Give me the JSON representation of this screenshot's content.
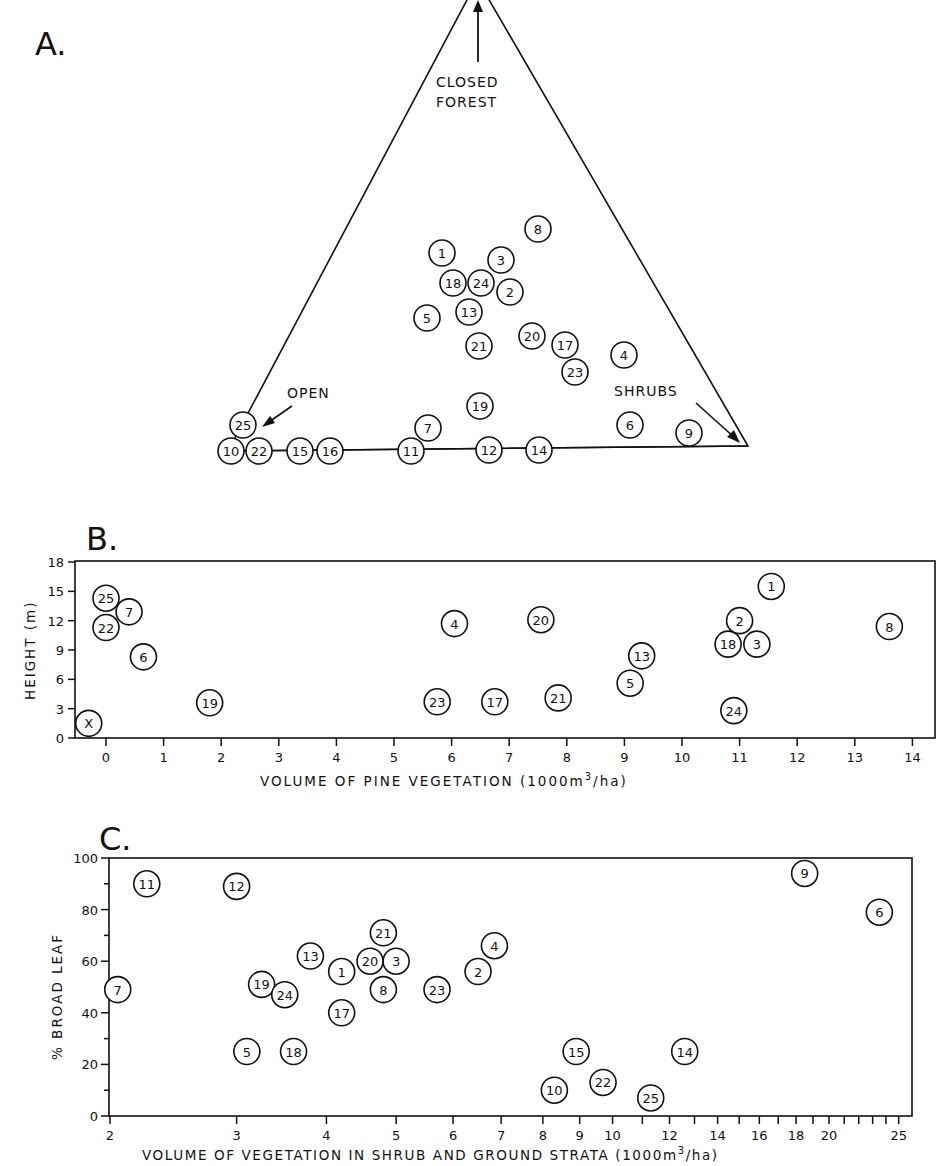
{
  "chart_data": [
    {
      "panel": "A.",
      "type": "scatter",
      "subtype": "ternary",
      "title": "A.",
      "vertices": {
        "top": "CLOSED FOREST",
        "left": "OPEN",
        "right": "SHRUBS"
      },
      "points": [
        {
          "id": "8",
          "x": 538,
          "y": 229
        },
        {
          "id": "1",
          "x": 442,
          "y": 253
        },
        {
          "id": "3",
          "x": 501,
          "y": 260
        },
        {
          "id": "18",
          "x": 453,
          "y": 283
        },
        {
          "id": "24",
          "x": 481,
          "y": 283
        },
        {
          "id": "2",
          "x": 510,
          "y": 292
        },
        {
          "id": "5",
          "x": 427,
          "y": 318
        },
        {
          "id": "13",
          "x": 469,
          "y": 312
        },
        {
          "id": "20",
          "x": 532,
          "y": 336
        },
        {
          "id": "17",
          "x": 565,
          "y": 345
        },
        {
          "id": "21",
          "x": 479,
          "y": 346
        },
        {
          "id": "4",
          "x": 624,
          "y": 355
        },
        {
          "id": "23",
          "x": 575,
          "y": 372
        },
        {
          "id": "19",
          "x": 480,
          "y": 406
        },
        {
          "id": "7",
          "x": 428,
          "y": 428
        },
        {
          "id": "6",
          "x": 630,
          "y": 425
        },
        {
          "id": "9",
          "x": 689,
          "y": 433
        },
        {
          "id": "25",
          "x": 243,
          "y": 425
        },
        {
          "id": "10",
          "x": 231,
          "y": 451
        },
        {
          "id": "22",
          "x": 259,
          "y": 451
        },
        {
          "id": "15",
          "x": 300,
          "y": 451
        },
        {
          "id": "16",
          "x": 330,
          "y": 451
        },
        {
          "id": "11",
          "x": 411,
          "y": 451
        },
        {
          "id": "12",
          "x": 489,
          "y": 450
        },
        {
          "id": "14",
          "x": 539,
          "y": 450
        }
      ]
    },
    {
      "panel": "B.",
      "type": "scatter",
      "title": "B.",
      "xlabel": "VOLUME OF PINE VEGETATION (1000m3/ha)",
      "xlabel_main": "VOLUME OF PINE VEGETATION (1000m",
      "xlabel_sup": "3",
      "xlabel_end": "/ha)",
      "ylabel": "HEIGHT (m)",
      "xlim": [
        -0.6,
        14.5
      ],
      "ylim": [
        0,
        18
      ],
      "xticks": [
        0,
        1,
        2,
        3,
        4,
        5,
        6,
        7,
        8,
        9,
        10,
        11,
        12,
        13,
        14
      ],
      "yticks": [
        0,
        3,
        6,
        9,
        12,
        15,
        18
      ],
      "points": [
        {
          "id": "X",
          "x": -0.3,
          "y": 1.5
        },
        {
          "id": "25",
          "x": 0.0,
          "y": 14.3
        },
        {
          "id": "22",
          "x": 0.0,
          "y": 11.3
        },
        {
          "id": "7",
          "x": 0.4,
          "y": 12.9
        },
        {
          "id": "6",
          "x": 0.65,
          "y": 8.3
        },
        {
          "id": "19",
          "x": 1.8,
          "y": 3.6
        },
        {
          "id": "4",
          "x": 6.05,
          "y": 11.7
        },
        {
          "id": "23",
          "x": 5.75,
          "y": 3.7
        },
        {
          "id": "17",
          "x": 6.75,
          "y": 3.7
        },
        {
          "id": "20",
          "x": 7.55,
          "y": 12.1
        },
        {
          "id": "21",
          "x": 7.85,
          "y": 4.1
        },
        {
          "id": "13",
          "x": 9.3,
          "y": 8.4
        },
        {
          "id": "5",
          "x": 9.1,
          "y": 5.6
        },
        {
          "id": "1",
          "x": 11.55,
          "y": 15.5
        },
        {
          "id": "2",
          "x": 11.0,
          "y": 12.0
        },
        {
          "id": "18",
          "x": 10.8,
          "y": 9.6
        },
        {
          "id": "3",
          "x": 11.3,
          "y": 9.6
        },
        {
          "id": "24",
          "x": 10.9,
          "y": 2.8
        },
        {
          "id": "8",
          "x": 13.6,
          "y": 11.4
        }
      ]
    },
    {
      "panel": "C.",
      "type": "scatter",
      "title": "C.",
      "xscale": "log",
      "xlabel": "VOLUME OF VEGETATION IN SHRUB AND GROUND STRATA (1000m3/ha)",
      "xlabel_main": "VOLUME OF VEGETATION IN SHRUB AND GROUND STRATA (1000m",
      "xlabel_sup": "3",
      "xlabel_end": "/ha)",
      "ylabel": "% BROAD LEAF",
      "xlim": [
        2,
        26
      ],
      "ylim": [
        0,
        100
      ],
      "xticks": [
        2,
        3,
        4,
        5,
        6,
        7,
        8,
        9,
        10,
        12,
        14,
        16,
        18,
        20,
        25
      ],
      "yticks": [
        0,
        20,
        40,
        60,
        80,
        100
      ],
      "points": [
        {
          "id": "7",
          "x": 2.05,
          "y": 49
        },
        {
          "id": "11",
          "x": 2.25,
          "y": 90
        },
        {
          "id": "12",
          "x": 3.0,
          "y": 89
        },
        {
          "id": "5",
          "x": 3.1,
          "y": 25
        },
        {
          "id": "19",
          "x": 3.25,
          "y": 51
        },
        {
          "id": "24",
          "x": 3.5,
          "y": 47
        },
        {
          "id": "18",
          "x": 3.6,
          "y": 25
        },
        {
          "id": "13",
          "x": 3.8,
          "y": 62
        },
        {
          "id": "1",
          "x": 4.2,
          "y": 56
        },
        {
          "id": "17",
          "x": 4.2,
          "y": 40
        },
        {
          "id": "20",
          "x": 4.6,
          "y": 60
        },
        {
          "id": "21",
          "x": 4.8,
          "y": 71
        },
        {
          "id": "3",
          "x": 5.0,
          "y": 60
        },
        {
          "id": "8",
          "x": 4.8,
          "y": 49
        },
        {
          "id": "23",
          "x": 5.7,
          "y": 49
        },
        {
          "id": "2",
          "x": 6.5,
          "y": 56
        },
        {
          "id": "4",
          "x": 6.85,
          "y": 66
        },
        {
          "id": "10",
          "x": 8.3,
          "y": 10
        },
        {
          "id": "15",
          "x": 8.9,
          "y": 25
        },
        {
          "id": "22",
          "x": 9.7,
          "y": 13
        },
        {
          "id": "25",
          "x": 11.3,
          "y": 7
        },
        {
          "id": "14",
          "x": 12.6,
          "y": 25
        },
        {
          "id": "9",
          "x": 18.5,
          "y": 94
        },
        {
          "id": "6",
          "x": 23.5,
          "y": 79
        }
      ]
    }
  ],
  "labels": {
    "panel_a": "A.",
    "panel_b": "B.",
    "panel_c": "C.",
    "closed": "CLOSED",
    "forest": "FOREST",
    "open": "OPEN",
    "shrubs": "SHRUBS"
  }
}
